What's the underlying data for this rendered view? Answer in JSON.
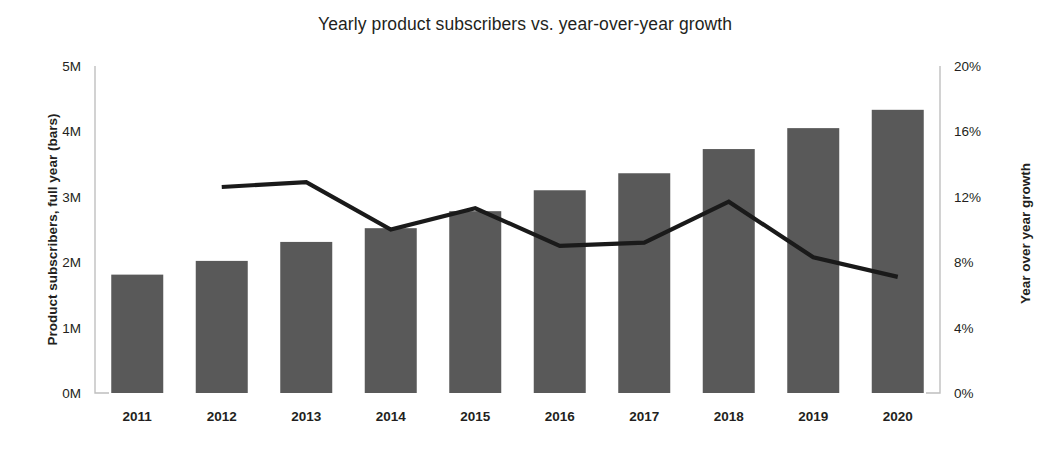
{
  "chart_data": {
    "type": "bar",
    "title": "Yearly product subscribers vs. year-over-year growth",
    "xlabel": "",
    "ylabel": "Product subscribers, full year (bars)",
    "y2label": "Year over year growth",
    "categories": [
      "2011",
      "2012",
      "2013",
      "2014",
      "2015",
      "2016",
      "2017",
      "2018",
      "2019",
      "2020"
    ],
    "ylim": [
      0,
      5000000
    ],
    "y2lim": [
      0,
      20
    ],
    "yticks": [
      0,
      1000000,
      2000000,
      3000000,
      4000000,
      5000000
    ],
    "ytick_labels": [
      "0M",
      "1M",
      "2M",
      "3M",
      "4M",
      "5M"
    ],
    "y2ticks": [
      0,
      4,
      8,
      12,
      16,
      20
    ],
    "y2tick_labels": [
      "0%",
      "4%",
      "8%",
      "12%",
      "16%",
      "20%"
    ],
    "grid": false,
    "legend": "none",
    "series": [
      {
        "name": "Product subscribers, full year",
        "type": "bar",
        "axis": "left",
        "color": "#595959",
        "values": [
          1810000,
          2020000,
          2310000,
          2520000,
          2780000,
          3100000,
          3360000,
          3730000,
          4050000,
          4330000
        ]
      },
      {
        "name": "Year over year growth",
        "type": "line",
        "axis": "right",
        "color": "#1a1a1a",
        "values": [
          null,
          12.6,
          12.9,
          10.0,
          11.3,
          9.0,
          9.2,
          11.7,
          8.3,
          7.1
        ]
      }
    ]
  }
}
